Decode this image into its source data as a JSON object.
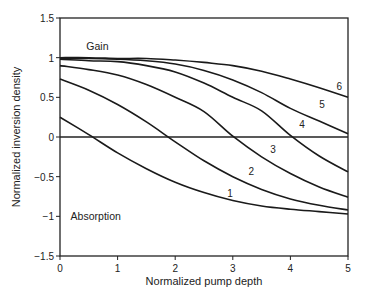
{
  "chart_data": {
    "type": "line",
    "title": "",
    "xlabel": "Normalized pump depth",
    "ylabel": "Normalized inversion density",
    "xlim": [
      0,
      5
    ],
    "ylim": [
      -1.5,
      1.5
    ],
    "xticks": [
      0,
      1,
      2,
      3,
      4,
      5
    ],
    "yticks": [
      1.5,
      1,
      0.5,
      0,
      -0.5,
      -1,
      -1.5
    ],
    "ytick_labels": [
      "1.5",
      "1",
      "0.5",
      "0",
      "−0.5",
      "−1",
      "−1.5"
    ],
    "xtick_labels": [
      "0",
      "1",
      "2",
      "3",
      "4",
      "5"
    ],
    "grid": false,
    "legend": "none (curves labeled inline)",
    "annotations": [
      {
        "text": "Gain",
        "x": 0.65,
        "y": 1.15
      },
      {
        "text": "Absorption",
        "x": 0.62,
        "y": -1.0
      }
    ],
    "x": [
      0,
      0.5,
      1,
      1.5,
      2,
      2.5,
      3,
      3.5,
      4,
      4.5,
      5
    ],
    "series": [
      {
        "name": "1",
        "label_pos": [
          2.95,
          -0.7
        ],
        "values": [
          0.25,
          0.03,
          -0.2,
          -0.4,
          -0.57,
          -0.7,
          -0.8,
          -0.87,
          -0.91,
          -0.94,
          -0.97
        ]
      },
      {
        "name": "2",
        "label_pos": [
          3.32,
          -0.43
        ],
        "values": [
          0.73,
          0.59,
          0.41,
          0.19,
          -0.06,
          -0.3,
          -0.5,
          -0.66,
          -0.78,
          -0.86,
          -0.92
        ]
      },
      {
        "name": "3",
        "label_pos": [
          3.7,
          -0.15
        ],
        "values": [
          0.9,
          0.85,
          0.78,
          0.66,
          0.5,
          0.32,
          0.01,
          -0.25,
          -0.46,
          -0.63,
          -0.76
        ]
      },
      {
        "name": "4",
        "label_pos": [
          4.2,
          0.16
        ],
        "values": [
          0.98,
          0.96,
          0.95,
          0.9,
          0.82,
          0.68,
          0.5,
          0.33,
          0.02,
          -0.24,
          -0.44
        ]
      },
      {
        "name": "5",
        "label_pos": [
          4.55,
          0.42
        ],
        "values": [
          0.99,
          0.99,
          0.98,
          0.96,
          0.92,
          0.84,
          0.72,
          0.56,
          0.36,
          0.2,
          0.04
        ]
      },
      {
        "name": "6",
        "label_pos": [
          4.85,
          0.64
        ],
        "values": [
          1.0,
          1.0,
          0.99,
          0.99,
          0.97,
          0.94,
          0.9,
          0.83,
          0.73,
          0.62,
          0.5
        ]
      }
    ]
  }
}
